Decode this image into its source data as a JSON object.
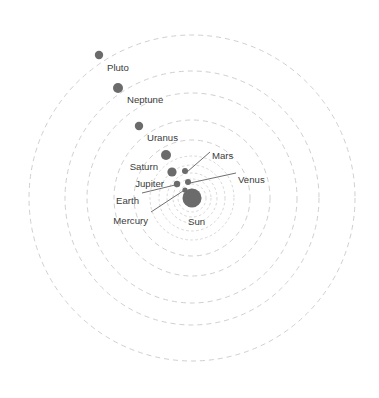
{
  "figure": {
    "background_color": "#ffffff",
    "partial_caption_top": "",
    "orbit_color": "#c9c9c9",
    "body_color": "#6b6b6b",
    "sun_color": "#6b6b6b",
    "leader_color": "#4a4a4a",
    "label_color": "#3b3b3b"
  },
  "chart_data": {
    "type": "scatter",
    "xlabel": "",
    "ylabel": "",
    "grid": false,
    "legend_position": "none",
    "center": {
      "name": "Sun",
      "cx": 192,
      "cy": 198,
      "r": 9.5
    },
    "orbits": [
      {
        "name": "Mercury",
        "r": 9
      },
      {
        "name": "Venus",
        "r": 14
      },
      {
        "name": "Earth",
        "r": 19
      },
      {
        "name": "Mars",
        "r": 25
      },
      {
        "name": "Jupiter",
        "r": 33
      },
      {
        "name": "Saturn",
        "r": 42
      },
      {
        "name": "Uranus",
        "r": 58
      },
      {
        "name": "Uranus2",
        "r": 78
      },
      {
        "name": "Neptune",
        "r": 105
      },
      {
        "name": "Pluto",
        "r": 127
      },
      {
        "name": "PlutoOuter",
        "r": 163
      }
    ],
    "bodies": [
      {
        "name": "Pluto",
        "cx": 99,
        "cy": 55,
        "r": 4.2,
        "label": "Pluto",
        "label_x": 107,
        "label_y": 63,
        "anchor": "left",
        "leader": false
      },
      {
        "name": "Neptune",
        "cx": 118,
        "cy": 88,
        "r": 5.0,
        "label": "Neptune",
        "label_x": 127,
        "label_y": 95,
        "anchor": "left",
        "leader": false
      },
      {
        "name": "Uranus",
        "cx": 139,
        "cy": 126,
        "r": 4.2,
        "label": "Uranus",
        "label_x": 147,
        "label_y": 133,
        "anchor": "left",
        "leader": false
      },
      {
        "name": "Saturn",
        "cx": 166,
        "cy": 155,
        "r": 5.0,
        "label": "Saturn",
        "label_x": 158,
        "label_y": 162,
        "anchor": "right",
        "leader": false
      },
      {
        "name": "Jupiter",
        "cx": 172,
        "cy": 172,
        "r": 4.6,
        "label": "Jupiter",
        "label_x": 164,
        "label_y": 179,
        "anchor": "right",
        "leader": false
      },
      {
        "name": "Mars",
        "cx": 185,
        "cy": 171,
        "r": 3.0,
        "label": "Mars",
        "label_x": 212,
        "label_y": 151,
        "anchor": "left",
        "leader": true,
        "lx1": 210,
        "ly1": 152,
        "lx2": 187,
        "ly2": 172
      },
      {
        "name": "Venus",
        "cx": 188,
        "cy": 182,
        "r": 3.0,
        "label": "Venus",
        "label_x": 238,
        "label_y": 175,
        "anchor": "left",
        "leader": true,
        "lx1": 236,
        "ly1": 173,
        "lx2": 190,
        "ly2": 183
      },
      {
        "name": "Earth",
        "cx": 177,
        "cy": 184,
        "r": 3.2,
        "label": "Earth",
        "label_x": 139,
        "label_y": 196,
        "anchor": "right",
        "leader": true,
        "lx1": 142,
        "ly1": 193,
        "lx2": 175,
        "ly2": 185
      },
      {
        "name": "Mercury",
        "cx": 185,
        "cy": 190,
        "r": 2.6,
        "label": "Mercury",
        "label_x": 148,
        "label_y": 216,
        "anchor": "right",
        "leader": true,
        "lx1": 151,
        "ly1": 212,
        "lx2": 183,
        "ly2": 191
      },
      {
        "name": "Sun",
        "cx": 192,
        "cy": 198,
        "r": 9.5,
        "label": "Sun",
        "label_x": 188,
        "label_y": 217,
        "anchor": "left",
        "leader": false
      }
    ]
  }
}
